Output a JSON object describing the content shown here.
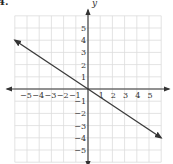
{
  "problem_label": "4.",
  "chart_data": {
    "type": "line",
    "title": "",
    "xlabel": "",
    "ylabel": "y",
    "xlim": [
      -6,
      6
    ],
    "ylim": [
      -6,
      6
    ],
    "grid": true,
    "x_ticks": [
      -5,
      -4,
      -3,
      -2,
      -1,
      1,
      2,
      3,
      4,
      5
    ],
    "y_ticks": [
      -5,
      -4,
      -3,
      -2,
      -1,
      1,
      2,
      3,
      4,
      5
    ],
    "series": [
      {
        "name": "line",
        "x": [
          -6,
          0,
          6
        ],
        "y": [
          4,
          0,
          -4
        ],
        "slope": -0.6667,
        "intercept": 0,
        "arrows": "both"
      }
    ]
  },
  "colors": {
    "grid": "#dcdcdc",
    "axis": "#333333",
    "line": "#3a3a3a",
    "text": "#333333"
  }
}
